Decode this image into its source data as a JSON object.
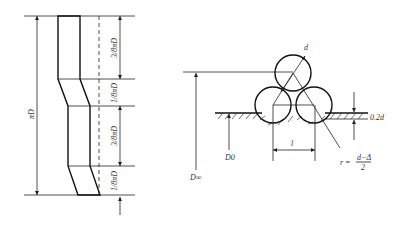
{
  "left_figure": {
    "total_label": "πD",
    "segments": [
      {
        "label": "3/8πD"
      },
      {
        "label": "1/8πD"
      },
      {
        "label": "3/8πD"
      },
      {
        "label": "1/8πD"
      }
    ]
  },
  "right_figure": {
    "diameter_label": "d",
    "outer_diameter_label": "D∞",
    "inner_diameter_label": "D0",
    "pitch_label": "l",
    "offset_label": "0.2d",
    "radius_label_prefix": "r =",
    "radius_numerator": "d−Δ",
    "radius_denominator": "2"
  },
  "colors": {
    "line": "#222222",
    "background": "#ffffff"
  }
}
